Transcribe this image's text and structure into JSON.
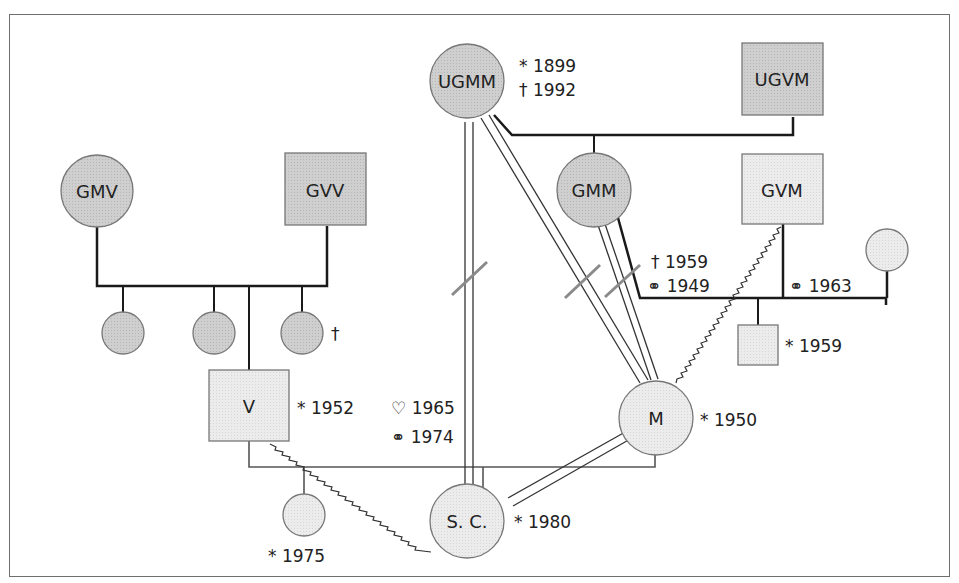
{
  "diagram": {
    "type": "genogram",
    "colors": {
      "dark_fill": "#c9c9c9",
      "light_fill": "#e6e6e6",
      "stroke": "#1a1a1a",
      "outline": "#777777",
      "cut_mark": "#8a8a8a"
    },
    "nodes": {
      "ugmm": {
        "label": "UGMM",
        "shape": "circle",
        "annotations": [
          "* 1899",
          "† 1992"
        ]
      },
      "ugvm": {
        "label": "UGVM",
        "shape": "square",
        "annotations": []
      },
      "gmv": {
        "label": "GMV",
        "shape": "circle",
        "annotations": []
      },
      "gvv": {
        "label": "GVV",
        "shape": "square",
        "annotations": []
      },
      "gmm": {
        "label": "GMM",
        "shape": "circle",
        "annotations": []
      },
      "gvm": {
        "label": "GVM",
        "shape": "square",
        "annotations": []
      },
      "v": {
        "label": "V",
        "shape": "square",
        "annotations": [
          "* 1952"
        ]
      },
      "m": {
        "label": "M",
        "shape": "circle",
        "annotations": [
          "* 1950"
        ]
      },
      "sc": {
        "label": "S. C.",
        "shape": "circle",
        "annotations": [
          "* 1980"
        ]
      },
      "sister_sc": {
        "label": "",
        "shape": "circle",
        "annotations": [
          "* 1975"
        ]
      },
      "half_brother_m": {
        "label": "",
        "shape": "square",
        "annotations": [
          "* 1959"
        ]
      },
      "aunt_v_1": {
        "label": "",
        "shape": "circle",
        "annotations": []
      },
      "aunt_v_2": {
        "label": "",
        "shape": "circle",
        "annotations": []
      },
      "aunt_v_3": {
        "label": "",
        "shape": "circle",
        "annotations": [
          "†"
        ]
      },
      "gvm_wife2": {
        "label": "",
        "shape": "circle",
        "annotations": []
      }
    },
    "relationship_labels": {
      "gmm_gvm": {
        "death": "† 1959",
        "marriage": "⚭ 1949"
      },
      "gvm_wife2": {
        "marriage": "⚭ 1963"
      },
      "v_m": {
        "engaged": "♡ 1965",
        "marriage": "⚭ 1974"
      }
    },
    "symbols": {
      "birth": "*",
      "death": "†",
      "marriage": "⚭",
      "heart": "♡"
    }
  }
}
